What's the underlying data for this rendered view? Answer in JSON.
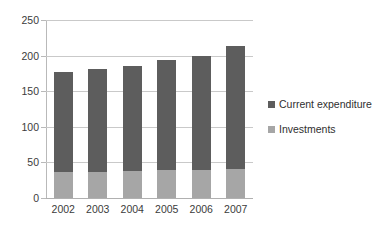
{
  "chart_data": {
    "type": "bar",
    "stacked": true,
    "title": "",
    "subtitle": "",
    "xlabel": "",
    "ylabel": "",
    "categories": [
      "2002",
      "2003",
      "2004",
      "2005",
      "2006",
      "2007"
    ],
    "series": [
      {
        "name": "Investments",
        "color": "#a6a6a6",
        "values": [
          37,
          37,
          38,
          39,
          40,
          41
        ]
      },
      {
        "name": "Current expenditure",
        "color": "#5d5d5d",
        "values": [
          140,
          144,
          148,
          155,
          160,
          173
        ]
      }
    ],
    "totals": [
      177,
      181,
      186,
      194,
      200,
      214
    ],
    "ylim": [
      0,
      250
    ],
    "yticks": [
      0,
      50,
      100,
      150,
      200,
      250
    ],
    "ytick_labels": [
      "0",
      "50",
      "100",
      "150",
      "200",
      "250"
    ],
    "grid": true,
    "legend_position": "right",
    "legend": [
      {
        "label": "Current expenditure",
        "color": "#5d5d5d"
      },
      {
        "label": "Investments",
        "color": "#a6a6a6"
      }
    ]
  },
  "colors": {
    "current_expenditure": "#5d5d5d",
    "investments": "#a6a6a6",
    "gridline": "#c9c9c9",
    "axis": "#b9b9b9",
    "text": "#3b3b3b",
    "background": "#ffffff"
  }
}
